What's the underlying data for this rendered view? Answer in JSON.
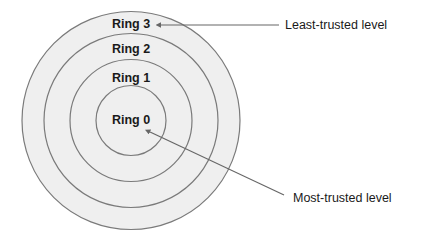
{
  "diagram": {
    "type": "concentric-rings",
    "center": {
      "x": 131,
      "y": 120.5
    },
    "colors": {
      "ring_fill": "#efefef",
      "ring_stroke": "#7a7a7a",
      "leader": "#666666",
      "text": "#1a1a1a",
      "background": "#ffffff"
    },
    "rings": [
      {
        "id": "ring-3",
        "label": "Ring 3",
        "radius": 109,
        "label_y": 28
      },
      {
        "id": "ring-2",
        "label": "Ring 2",
        "radius": 87,
        "label_y": 53
      },
      {
        "id": "ring-1",
        "label": "Ring 1",
        "radius": 61,
        "label_y": 82
      },
      {
        "id": "ring-0",
        "label": "Ring 0",
        "radius": 35,
        "label_y": 124
      }
    ],
    "callouts": {
      "least": {
        "text": "Least-trusted level",
        "points_to": "Ring 3"
      },
      "most": {
        "text": "Most-trusted level",
        "points_to": "Ring 0"
      }
    }
  }
}
